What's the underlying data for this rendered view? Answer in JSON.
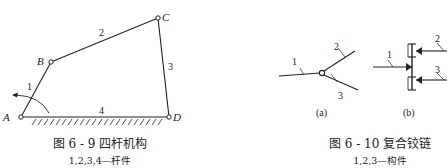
{
  "figure_left": {
    "caption": "图 6 - 9    四杆机构",
    "subcaption": "1,2,3,4—杆件",
    "joints": [
      {
        "label": "A"
      },
      {
        "label": "B"
      },
      {
        "label": "C"
      },
      {
        "label": "D"
      }
    ],
    "links": [
      {
        "label": "1"
      },
      {
        "label": "2"
      },
      {
        "label": "3"
      },
      {
        "label": "4"
      }
    ]
  },
  "figure_right": {
    "caption": "图 6 - 10    复合铰链",
    "subcaption": "1,2,3—构件",
    "sub_a": {
      "label": "(a)",
      "links": [
        {
          "label": "1"
        },
        {
          "label": "2"
        },
        {
          "label": "3"
        }
      ]
    },
    "sub_b": {
      "label": "(b)",
      "links": [
        {
          "label": "1"
        },
        {
          "label": "2"
        },
        {
          "label": "3"
        }
      ]
    }
  },
  "colors": {
    "line": "#222222",
    "background": "#ffffff"
  }
}
